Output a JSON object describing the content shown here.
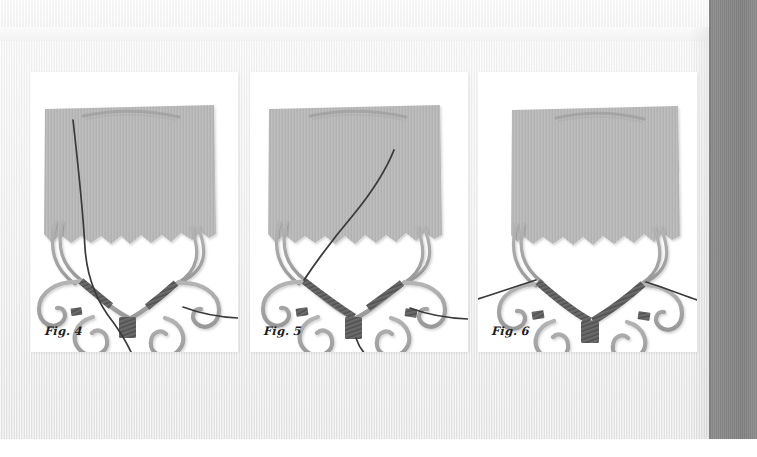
{
  "document": {
    "kind": "craft-instruction-book-page",
    "background_color": "#ededed",
    "right_band_color": "#8a8a8a",
    "panel_background": "#ffffff"
  },
  "palette": {
    "fabric": "#b8b8b8",
    "fabric_shadow": "#9d9d9d",
    "wire_light": "#a9a9a9",
    "wire_light_edge": "#959595",
    "wrap_dark": "#5e5e5e",
    "wrap_dark_edge": "#4a4a4a",
    "thread": "#3a3a3a",
    "caption": "#1d1d1d"
  },
  "panels": [
    {
      "id": "panel-1",
      "caption": "Fig. 4",
      "icon": "wire-scroll-necklace-icon",
      "description": "Scroll-wire necklace front with torn fabric above; single thread passes down through the left side and exits below the centre plate.",
      "thread_count": 1,
      "wrap_segments": 4
    },
    {
      "id": "panel-2",
      "caption": "Fig. 5",
      "icon": "wire-scroll-necklace-icon",
      "description": "Thread drawn up diagonally to the right across the fabric; left collar bar now fully wrapped, tail hangs below centre.",
      "thread_count": 2,
      "wrap_segments": 5
    },
    {
      "id": "panel-3",
      "caption": "Fig. 6",
      "icon": "wire-scroll-necklace-icon",
      "description": "Both collar bars fully wrapped and symmetrical; threads exit left and right beyond the outer scrolls.",
      "thread_count": 2,
      "wrap_segments": 6
    }
  ]
}
